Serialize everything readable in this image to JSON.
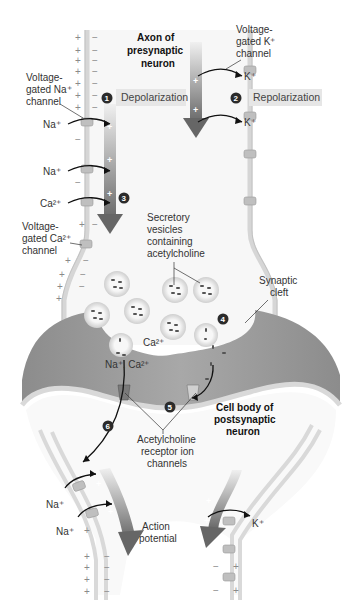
{
  "diagram": {
    "title_presynaptic": [
      "Axon of",
      "presynaptic",
      "neuron"
    ],
    "title_postsynaptic": [
      "Cell body of",
      "postsynaptic",
      "neuron"
    ],
    "steps": [
      {
        "num": "1",
        "label": "Depolarization"
      },
      {
        "num": "2",
        "label": "Repolarization"
      },
      {
        "num": "3",
        "label": ""
      },
      {
        "num": "4",
        "label": ""
      },
      {
        "num": "5",
        "label": ""
      },
      {
        "num": "6",
        "label": ""
      }
    ],
    "labels": {
      "na_channel": [
        "Voltage-",
        "gated Na⁺",
        "channel"
      ],
      "k_channel": [
        "Voltage-",
        "gated K⁺",
        "channel"
      ],
      "ca_channel": [
        "Voltage-",
        "gated Ca²⁺",
        "channel"
      ],
      "vesicles": [
        "Secretory",
        "vesicles",
        "containing",
        "acetylcholine"
      ],
      "synaptic_cleft": [
        "Synaptic",
        "cleft"
      ],
      "ach_receptors": [
        "Acetylcholine",
        "receptor ion",
        "channels"
      ],
      "action_potential": [
        "Action",
        "potential"
      ]
    },
    "ions": {
      "na": "Na⁺",
      "k": "K⁺",
      "ca": "Ca²⁺",
      "na_ca": "Na⁺, Ca²⁺"
    },
    "charges": {
      "plus": "+",
      "minus": "−"
    },
    "colors": {
      "membrane": "#d9d9d9",
      "membrane_edge": "#bdbdbd",
      "cleft": "#8f8f8f",
      "cleft_light": "#b8b8b8",
      "arrow_top": "#e8e8e8",
      "arrow_bottom": "#6e6e6e",
      "step_badge": "#2b2b2b",
      "phase_box": "#e6e6e6",
      "channel": "#a9a9a9"
    }
  }
}
